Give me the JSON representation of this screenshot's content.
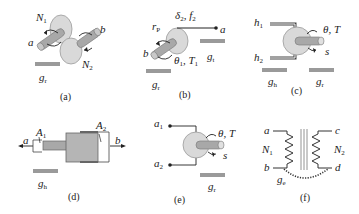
{
  "figure": {
    "panels": [
      {
        "id": "a",
        "caption": "(a)",
        "labels": {
          "n1": "N",
          "n1_sub": "1",
          "n2": "N",
          "n2_sub": "2",
          "a": "a",
          "b": "b",
          "ground": "g",
          "ground_sub": "r"
        }
      },
      {
        "id": "b",
        "caption": "(b)",
        "labels": {
          "rp": "r",
          "rp_sub": "P",
          "delta": "δ",
          "delta_sub": "2",
          "f": ", f",
          "f_sub": "2",
          "a": "a",
          "b": "b",
          "theta": "θ",
          "theta_sub": "1",
          "T": ", T",
          "T_sub": "1",
          "gt": "g",
          "gt_sub": "t",
          "gr": "g",
          "gr_sub": "r"
        }
      },
      {
        "id": "c",
        "caption": "(c)",
        "labels": {
          "h1": "h",
          "h1_sub": "1",
          "h2": "h",
          "h2_sub": "2",
          "thetaT": "θ, T",
          "s": "s",
          "gh": "g",
          "gh_sub": "h",
          "gr": "g",
          "gr_sub": "r"
        }
      },
      {
        "id": "d",
        "caption": "(d)",
        "labels": {
          "A1": "A",
          "A1_sub": "1",
          "A2": "A",
          "A2_sub": "2",
          "a": "a",
          "b": "b",
          "gh": "g",
          "gh_sub": "h"
        }
      },
      {
        "id": "e",
        "caption": "(e)",
        "labels": {
          "a1": "a",
          "a1_sub": "1",
          "a2": "a",
          "a2_sub": "2",
          "thetaT": "θ, T",
          "s": "s",
          "gr": "g",
          "gr_sub": "r"
        }
      },
      {
        "id": "f",
        "caption": "(f)",
        "labels": {
          "a": "a",
          "b": "b",
          "c": "c",
          "d": "d",
          "N1": "N",
          "N1_sub": "1",
          "N2": "N",
          "N2_sub": "2",
          "ge": "g",
          "ge_sub": "e"
        }
      }
    ],
    "colors": {
      "disc_fill": "#d9d9d9",
      "disc_stroke": "#9a9a9a",
      "shaft_fill": "#a8a8a8",
      "ground_bar": "#9a9a9a",
      "line": "#333333",
      "cylinder_fill": "#b5b5b5"
    }
  }
}
